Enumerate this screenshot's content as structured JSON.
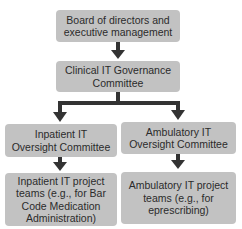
{
  "diagram": {
    "type": "org-chart",
    "nodes": [
      {
        "id": "board",
        "label": "Board of directors and executive management"
      },
      {
        "id": "clinical_it",
        "label": "Clinical IT Governance Committee"
      },
      {
        "id": "inpatient_oversight",
        "label": "Inpatient IT Oversight Committee"
      },
      {
        "id": "ambulatory_oversight",
        "label": "Ambulatory IT Oversight Committee"
      },
      {
        "id": "inpatient_teams",
        "label": "Inpatient IT project teams (e.g., for Bar Code Medication Administration)"
      },
      {
        "id": "ambulatory_teams",
        "label": "Ambulatory IT project teams (e.g., for eprescribing)"
      }
    ],
    "edges": [
      {
        "from": "board",
        "to": "clinical_it"
      },
      {
        "from": "clinical_it",
        "to": "inpatient_oversight"
      },
      {
        "from": "clinical_it",
        "to": "ambulatory_oversight"
      },
      {
        "from": "inpatient_oversight",
        "to": "inpatient_teams"
      },
      {
        "from": "ambulatory_oversight",
        "to": "ambulatory_teams"
      }
    ],
    "colors": {
      "box": "#c2c2c2",
      "arrow": "#333333",
      "text": "#2b2b2b"
    }
  }
}
